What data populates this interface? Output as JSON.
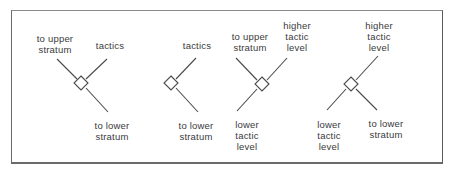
{
  "diagrams": [
    {
      "id": "d1",
      "labels": {
        "upper_left": "to upper\nstratum",
        "upper_right": "tactics",
        "lower_right": "to lower\nstratum"
      }
    },
    {
      "id": "d2",
      "labels": {
        "upper_right": "tactics",
        "lower_right": "to lower\nstratum"
      }
    },
    {
      "id": "d3",
      "labels": {
        "upper_left": "to upper\nstratum",
        "upper_right": "higher\ntactic\nlevel",
        "lower_left": "lower\ntactic\nlevel"
      }
    },
    {
      "id": "d4",
      "labels": {
        "upper_right": "higher\ntactic\nlevel",
        "lower_left": "lower\ntactic\nlevel",
        "lower_right": "to lower\nstratum"
      }
    }
  ],
  "colors": {
    "line": "#4a4a4a",
    "text": "#3a3a3a",
    "frame": "#6a6a6a"
  }
}
